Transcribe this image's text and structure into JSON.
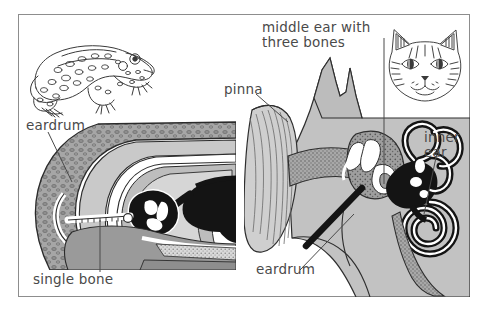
{
  "figure": {
    "border_color": "#8d8d8d",
    "background_color": "#ffffff",
    "text_color": "#4a4a4a"
  },
  "left_panel": {
    "name": "frog-ear-panel",
    "animal": "frog",
    "animal_icon": "frog-illustration",
    "diagram_icon": "frog-ear-cross-section",
    "labels": [
      {
        "id": "eardrum",
        "text": "eardrum"
      },
      {
        "id": "single_bone",
        "text": "single bone"
      }
    ]
  },
  "right_panel": {
    "name": "cat-ear-panel",
    "animal": "cat",
    "animal_icon": "cat-head-illustration",
    "diagram_icon": "mammal-ear-cross-section",
    "labels": [
      {
        "id": "middle_ear",
        "text": "middle ear with\nthree bones"
      },
      {
        "id": "pinna",
        "text": "pinna"
      },
      {
        "id": "inner_ear",
        "text": "inner\near"
      },
      {
        "id": "eardrum",
        "text": "eardrum"
      }
    ]
  },
  "palette": {
    "outline": "#1a1a1a",
    "skin_stipple": "#8a8a8a",
    "mid_gray": "#b9b9b9",
    "light_gray": "#d7d7d7",
    "dark_gray": "#6e6e6e",
    "black_fill": "#111111",
    "white_fill": "#ffffff"
  }
}
